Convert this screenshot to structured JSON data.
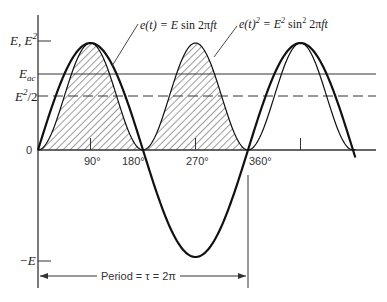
{
  "chart_data": {
    "type": "line",
    "title": "",
    "xlabel": "",
    "ylabel": "",
    "x_unit": "degrees",
    "x_ticks": [
      0,
      90,
      180,
      270,
      360,
      450,
      540
    ],
    "x_tick_labels": [
      "",
      "90°",
      "180°",
      "270°",
      "360°",
      "",
      ""
    ],
    "xlim": [
      0,
      575
    ],
    "ylim": [
      -1.25,
      1.2
    ],
    "y_markers": [
      {
        "label": "E, E²",
        "value": 1.0
      },
      {
        "label": "E_ac",
        "value": 0.7071
      },
      {
        "label": "E²/2",
        "value": 0.5
      },
      {
        "label": "0",
        "value": 0
      },
      {
        "label": "−E",
        "value": -1.0
      }
    ],
    "series": [
      {
        "name": "e(t) = E sin 2πft",
        "function": "sin",
        "amplitude": 1.0,
        "x_range": [
          0,
          545
        ],
        "style": "thick",
        "sample_points": [
          [
            0,
            0
          ],
          [
            90,
            1
          ],
          [
            180,
            0
          ],
          [
            270,
            -1
          ],
          [
            360,
            0
          ],
          [
            450,
            1
          ],
          [
            540,
            0
          ]
        ]
      },
      {
        "name": "e(t)² = E² sin² 2πft",
        "function": "sin2",
        "amplitude": 1.0,
        "x_range": [
          0,
          545
        ],
        "style": "thin-hatched",
        "sample_points": [
          [
            0,
            0
          ],
          [
            90,
            1
          ],
          [
            180,
            0
          ],
          [
            270,
            1
          ],
          [
            360,
            0
          ],
          [
            450,
            1
          ],
          [
            540,
            0
          ]
        ]
      }
    ],
    "reference_lines": [
      {
        "name": "E_ac (rms)",
        "value": 0.7071,
        "style": "solid"
      },
      {
        "name": "E²/2 (mean of sin²)",
        "value": 0.5,
        "style": "dashed"
      }
    ],
    "hatched_region": {
      "description": "area under e(t)² from 0° to 360°",
      "x_range": [
        0,
        360
      ]
    },
    "grid": false,
    "legend": "inline annotations with leader lines",
    "annotations": [
      {
        "text_parts": [
          "e(t) = E sin 2πft"
        ],
        "anchor_deg": 130,
        "anchor_val": 0.72
      },
      {
        "text_parts": [
          "e(t)² = E² sin² 2πft"
        ],
        "anchor_deg": 236,
        "anchor_val": 0.85
      }
    ],
    "period_label": "Period = τ = 2π",
    "period_range_deg": [
      0,
      360
    ]
  },
  "labels": {
    "y_top": {
      "base": "E, E",
      "sup": "2"
    },
    "y_eac": {
      "base": "E",
      "sub": "ac"
    },
    "y_half": {
      "base": "E",
      "sup": "2",
      "tail": "/2"
    },
    "y_zero": "0",
    "y_neg": "−E",
    "ann_sin": {
      "a": "e(t) = ",
      "b": "E",
      "c": " sin 2π",
      "d": "ft"
    },
    "ann_sin2": {
      "a": "e(t)",
      "sup1": "2",
      "b": " = ",
      "c": "E",
      "sup2": "2",
      "d": " sin",
      "sup3": "2",
      "e": " 2π",
      "f": "ft"
    },
    "tick_90": "90°",
    "tick_180": "180°",
    "tick_270": "270°",
    "tick_360": "360°",
    "period": "Period = τ = 2π"
  },
  "colors": {
    "ink": "#111111",
    "axis": "#333333",
    "hatch": "#222222",
    "background": "#ffffff"
  }
}
